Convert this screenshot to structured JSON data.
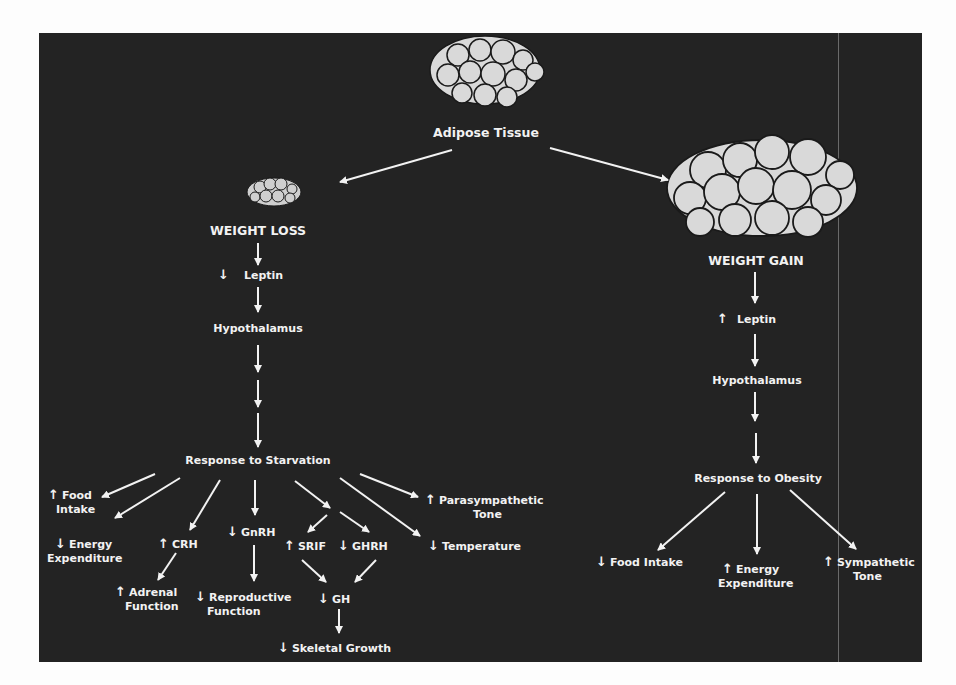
{
  "title": "Adipose Tissue",
  "left": {
    "heading": "WEIGHT LOSS",
    "leptin": {
      "label": "Leptin",
      "direction": "↓"
    },
    "hypothalamus": "Hypothalamus",
    "response": "Response to Starvation",
    "effects": {
      "food_intake": {
        "dir": "↑",
        "line1": "Food",
        "line2": "Intake"
      },
      "energy_expenditure": {
        "dir": "↓",
        "line1": "Energy",
        "line2": "Expenditure"
      },
      "crh": {
        "dir": "↑",
        "label": "CRH"
      },
      "adrenal": {
        "dir": "↑",
        "line1": "Adrenal",
        "line2": "Function"
      },
      "gnrh": {
        "dir": "↓",
        "label": "GnRH"
      },
      "reproductive": {
        "dir": "↓",
        "line1": "Reproductive",
        "line2": "Function"
      },
      "srif": {
        "dir": "↑",
        "label": "SRIF"
      },
      "ghrh": {
        "dir": "↓",
        "label": "GHRH"
      },
      "gh": {
        "dir": "↓",
        "label": "GH"
      },
      "skeletal": {
        "dir": "↓",
        "label": "Skeletal Growth"
      },
      "parasympathetic": {
        "dir": "↑",
        "line1": "Parasympathetic",
        "line2": "Tone"
      },
      "temperature": {
        "dir": "↓",
        "label": "Temperature"
      }
    }
  },
  "right": {
    "heading": "WEIGHT GAIN",
    "leptin": {
      "label": "Leptin",
      "direction": "↑"
    },
    "hypothalamus": "Hypothalamus",
    "response": "Response to Obesity",
    "effects": {
      "food_intake": {
        "dir": "↓",
        "label": "Food Intake"
      },
      "energy_expenditure": {
        "dir": "↑",
        "line1": "Energy",
        "line2": "Expenditure"
      },
      "sympathetic": {
        "dir": "↑",
        "line1": "Sympathetic",
        "line2": "Tone"
      }
    }
  },
  "colors": {
    "panel": "#232323",
    "text": "#f2f2f2",
    "cell_fill": "#d9d9d9",
    "cell_stroke": "#1a1a1a"
  }
}
